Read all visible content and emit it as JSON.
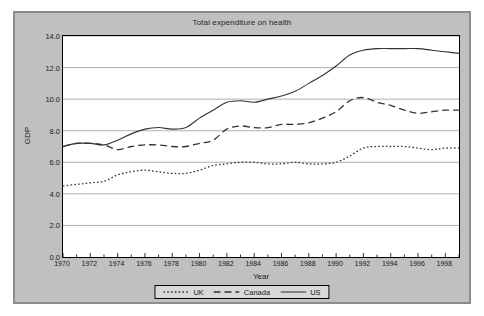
{
  "chart_data": {
    "type": "line",
    "title": "Total expenditure on health",
    "xlabel": "Year",
    "ylabel": "GDP",
    "xlim": [
      1970,
      1999
    ],
    "ylim": [
      0.0,
      14.0
    ],
    "grid": true,
    "legend_position": "bottom",
    "ytick_labels": [
      "14.0",
      "12.0",
      "10.0",
      "8.0",
      "6.0",
      "4.0",
      "2.0",
      "0.0"
    ],
    "ytick_values": [
      14.0,
      12.0,
      10.0,
      8.0,
      6.0,
      4.0,
      2.0,
      0.0
    ],
    "xtick_labels": [
      "1970",
      "1972",
      "1974",
      "1976",
      "1978",
      "1980",
      "1982",
      "1984",
      "1986",
      "1988",
      "1990",
      "1992",
      "1994",
      "1996",
      "1998"
    ],
    "xtick_values": [
      1970,
      1972,
      1974,
      1976,
      1978,
      1980,
      1982,
      1984,
      1986,
      1988,
      1990,
      1992,
      1994,
      1996,
      1998
    ],
    "x": [
      1970,
      1971,
      1972,
      1973,
      1974,
      1975,
      1976,
      1977,
      1978,
      1979,
      1980,
      1981,
      1982,
      1983,
      1984,
      1985,
      1986,
      1987,
      1988,
      1989,
      1990,
      1991,
      1992,
      1993,
      1994,
      1995,
      1996,
      1997,
      1998,
      1999
    ],
    "series": [
      {
        "name": "UK",
        "style": "dotted",
        "color": "#333333",
        "values": [
          4.5,
          4.6,
          4.7,
          4.8,
          5.2,
          5.4,
          5.5,
          5.4,
          5.3,
          5.3,
          5.5,
          5.8,
          5.9,
          6.0,
          6.0,
          5.9,
          5.9,
          6.0,
          5.9,
          5.9,
          6.0,
          6.4,
          6.9,
          7.0,
          7.0,
          7.0,
          6.9,
          6.8,
          6.9,
          6.9
        ]
      },
      {
        "name": "Canada",
        "style": "dashed",
        "color": "#333333",
        "values": [
          7.0,
          7.2,
          7.2,
          7.1,
          6.8,
          7.0,
          7.1,
          7.1,
          7.0,
          7.0,
          7.2,
          7.4,
          8.1,
          8.3,
          8.2,
          8.2,
          8.4,
          8.4,
          8.5,
          8.8,
          9.2,
          9.9,
          10.1,
          9.8,
          9.6,
          9.3,
          9.1,
          9.2,
          9.3,
          9.3
        ]
      },
      {
        "name": "US",
        "style": "solid",
        "color": "#333333",
        "values": [
          7.0,
          7.2,
          7.2,
          7.1,
          7.4,
          7.8,
          8.1,
          8.2,
          8.1,
          8.2,
          8.8,
          9.3,
          9.8,
          9.9,
          9.8,
          10.0,
          10.2,
          10.5,
          11.0,
          11.5,
          12.1,
          12.8,
          13.1,
          13.2,
          13.2,
          13.2,
          13.2,
          13.1,
          13.0,
          12.9
        ]
      }
    ]
  },
  "legend": {
    "items": [
      {
        "label": "UK"
      },
      {
        "label": "Canada"
      },
      {
        "label": "US"
      }
    ]
  }
}
